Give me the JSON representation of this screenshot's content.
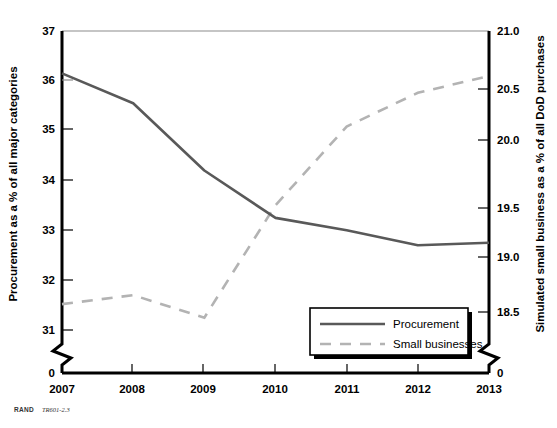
{
  "figure": {
    "source_credit_bold": "RAND",
    "source_credit_id": "TR601-2.3"
  },
  "legend": {
    "position": "inside-bottom-right",
    "items": [
      {
        "label": "Procurement",
        "style": "solid",
        "color": "#595959"
      },
      {
        "label": "Small businesses",
        "style": "dashed",
        "color": "#b3b3b3"
      }
    ]
  },
  "chart_data": {
    "type": "line",
    "title": "",
    "xlabel": "",
    "ylabel": "Procurement as a % of all major categories",
    "y2label": "Simulated small business as a % of all DoD purchases",
    "categories": [
      "2007",
      "2008",
      "2009",
      "2010",
      "2011",
      "2012",
      "2013"
    ],
    "x": [
      2007,
      2008,
      2009,
      2010,
      2011,
      2012,
      2013
    ],
    "ylim": [
      31,
      37
    ],
    "y2lim": [
      18.5,
      21.0
    ],
    "yticks": [
      31,
      32,
      33,
      34,
      35,
      36,
      37
    ],
    "ytick_labels": [
      "31",
      "32",
      "33",
      "34",
      "35",
      "36",
      "37"
    ],
    "y2ticks": [
      18.5,
      19.0,
      19.5,
      20.0,
      20.5,
      21.0
    ],
    "y2tick_labels": [
      "18.5",
      "19.0",
      "19.5",
      "20.0",
      "20.5",
      "21.0"
    ],
    "y_axis_break_label": "0",
    "y2_axis_break_label": "0",
    "grid": false,
    "axis_break": true,
    "series": [
      {
        "name": "Procurement",
        "axis": "left",
        "style": "solid",
        "color": "#595959",
        "values": [
          36.15,
          35.55,
          34.2,
          33.25,
          33.0,
          32.7,
          32.75
        ]
      },
      {
        "name": "Small businesses",
        "axis": "right",
        "style": "dashed",
        "color": "#b3b3b3",
        "values": [
          18.57,
          18.65,
          18.45,
          19.45,
          20.15,
          20.45,
          20.6
        ]
      }
    ]
  }
}
